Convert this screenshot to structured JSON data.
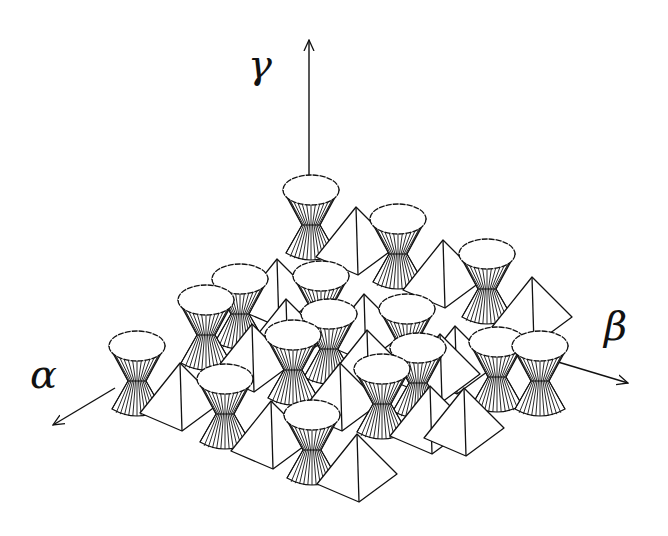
{
  "diagram": {
    "colors": {
      "stroke": "#111111",
      "background": "#ffffff",
      "fill": "#ffffff"
    },
    "axes": [
      {
        "name": "gamma",
        "label": "γ",
        "from": [
          309,
          183
        ],
        "to": [
          309,
          40
        ],
        "label_pos": [
          248,
          78
        ],
        "label_size": 40
      },
      {
        "name": "alpha",
        "label": "α",
        "from": [
          115,
          388
        ],
        "to": [
          53,
          425
        ],
        "label_pos": [
          30,
          388
        ],
        "label_size": 40
      },
      {
        "name": "beta",
        "label": "β",
        "from": [
          558,
          362
        ],
        "to": [
          628,
          383
        ],
        "label_pos": [
          604,
          340
        ],
        "label_size": 40
      }
    ],
    "hourglasses": [
      {
        "x": 311,
        "y": 190
      },
      {
        "x": 487,
        "y": 254
      },
      {
        "x": 398,
        "y": 219
      },
      {
        "x": 540,
        "y": 346
      },
      {
        "x": 240,
        "y": 279
      },
      {
        "x": 321,
        "y": 276
      },
      {
        "x": 407,
        "y": 309
      },
      {
        "x": 206,
        "y": 300
      },
      {
        "x": 329,
        "y": 314
      },
      {
        "x": 497,
        "y": 342
      },
      {
        "x": 418,
        "y": 348
      },
      {
        "x": 137,
        "y": 346
      },
      {
        "x": 293,
        "y": 335
      },
      {
        "x": 382,
        "y": 369
      },
      {
        "x": 225,
        "y": 379
      },
      {
        "x": 312,
        "y": 415
      }
    ],
    "pyramids": [
      {
        "x": 356,
        "y": 207
      },
      {
        "x": 443,
        "y": 240
      },
      {
        "x": 532,
        "y": 277
      },
      {
        "x": 277,
        "y": 259
      },
      {
        "x": 364,
        "y": 294
      },
      {
        "x": 286,
        "y": 299
      },
      {
        "x": 455,
        "y": 326
      },
      {
        "x": 252,
        "y": 324
      },
      {
        "x": 367,
        "y": 330
      },
      {
        "x": 440,
        "y": 334
      },
      {
        "x": 180,
        "y": 363
      },
      {
        "x": 340,
        "y": 363
      },
      {
        "x": 271,
        "y": 401
      },
      {
        "x": 430,
        "y": 386
      },
      {
        "x": 464,
        "y": 388
      },
      {
        "x": 357,
        "y": 434
      }
    ]
  }
}
